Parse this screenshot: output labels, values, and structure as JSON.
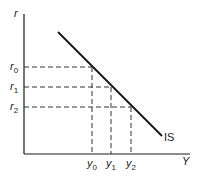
{
  "diagram": {
    "y_axis_label": "r",
    "x_axis_label": "Y",
    "curve_label": "IS",
    "r_levels": [
      {
        "sym": "r",
        "sub": "0"
      },
      {
        "sym": "r",
        "sub": "1"
      },
      {
        "sym": "r",
        "sub": "2"
      }
    ],
    "y_levels": [
      {
        "sym": "y",
        "sub": "0"
      },
      {
        "sym": "y",
        "sub": "1"
      },
      {
        "sym": "y",
        "sub": "2"
      }
    ],
    "colors": {
      "line": "#1a1a1a",
      "dash": "#333333"
    }
  }
}
